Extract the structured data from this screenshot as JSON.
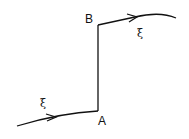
{
  "diagram": {
    "points": {
      "A": {
        "label": "A"
      },
      "B": {
        "label": "B"
      }
    },
    "symbols": {
      "incoming": "ξ",
      "outgoing": "ξ"
    },
    "colors": {
      "stroke": "#111111",
      "background": "#ffffff"
    }
  }
}
